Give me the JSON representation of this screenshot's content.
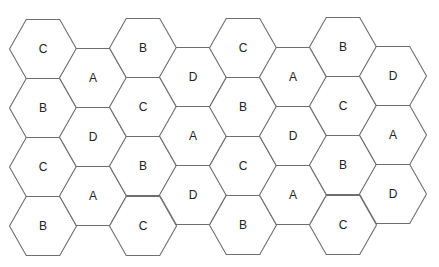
{
  "diagram": {
    "type": "hexagonal-cell-grid",
    "colors": {
      "background": "#ffffff",
      "stroke": "#6e6e6e",
      "text": "#222222"
    },
    "hex": {
      "orientation": "flat-top",
      "width": 67,
      "height": 59
    },
    "columns": [
      {
        "x": 43,
        "cells": [
          {
            "label": "C",
            "y": 49
          },
          {
            "label": "B",
            "y": 108
          },
          {
            "label": "C",
            "y": 167
          },
          {
            "label": "B",
            "y": 226
          }
        ]
      },
      {
        "x": 93,
        "cells": [
          {
            "label": "A",
            "y": 78
          },
          {
            "label": "D",
            "y": 137
          },
          {
            "label": "A",
            "y": 196
          }
        ]
      },
      {
        "x": 143,
        "cells": [
          {
            "label": "B",
            "y": 48
          },
          {
            "label": "C",
            "y": 107
          },
          {
            "label": "B",
            "y": 166
          },
          {
            "label": "C",
            "y": 226
          }
        ]
      },
      {
        "x": 193,
        "cells": [
          {
            "label": "D",
            "y": 77
          },
          {
            "label": "A",
            "y": 136
          },
          {
            "label": "D",
            "y": 195
          }
        ]
      },
      {
        "x": 243,
        "cells": [
          {
            "label": "C",
            "y": 48
          },
          {
            "label": "B",
            "y": 107
          },
          {
            "label": "C",
            "y": 166
          },
          {
            "label": "B",
            "y": 225
          }
        ]
      },
      {
        "x": 293,
        "cells": [
          {
            "label": "A",
            "y": 77
          },
          {
            "label": "D",
            "y": 136
          },
          {
            "label": "A",
            "y": 195
          }
        ]
      },
      {
        "x": 343,
        "cells": [
          {
            "label": "B",
            "y": 47
          },
          {
            "label": "C",
            "y": 106
          },
          {
            "label": "B",
            "y": 165
          },
          {
            "label": "C",
            "y": 225
          }
        ]
      },
      {
        "x": 393,
        "cells": [
          {
            "label": "D",
            "y": 76
          },
          {
            "label": "A",
            "y": 135
          },
          {
            "label": "D",
            "y": 194
          }
        ]
      }
    ]
  }
}
